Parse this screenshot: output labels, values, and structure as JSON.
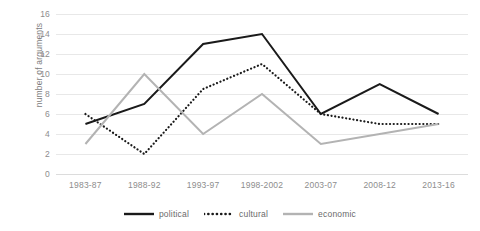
{
  "chart_data": {
    "type": "line",
    "title": "",
    "xlabel": "",
    "ylabel": "number of arguments",
    "categories": [
      "1983-87",
      "1988-92",
      "1993-97",
      "1998-2002",
      "2003-07",
      "2008-12",
      "2013-16"
    ],
    "ylim": [
      0,
      16
    ],
    "ytick_step": 2,
    "yticks": [
      16,
      14,
      12,
      10,
      8,
      6,
      4,
      2,
      0
    ],
    "grid": true,
    "legend_position": "bottom",
    "series": [
      {
        "name": "political",
        "values": [
          5,
          7,
          13,
          14,
          6,
          9,
          6
        ],
        "color": "#1a1a1a",
        "style": "solid"
      },
      {
        "name": "cultural",
        "values": [
          6,
          2,
          8.5,
          11,
          6,
          5,
          5
        ],
        "color": "#1a1a1a",
        "style": "dotted"
      },
      {
        "name": "economic",
        "values": [
          3,
          10,
          4,
          8,
          3,
          4,
          5
        ],
        "color": "#b3b3b3",
        "style": "solid"
      }
    ]
  },
  "legend": {
    "items": [
      {
        "label": "political"
      },
      {
        "label": "cultural"
      },
      {
        "label": "economic"
      }
    ]
  }
}
